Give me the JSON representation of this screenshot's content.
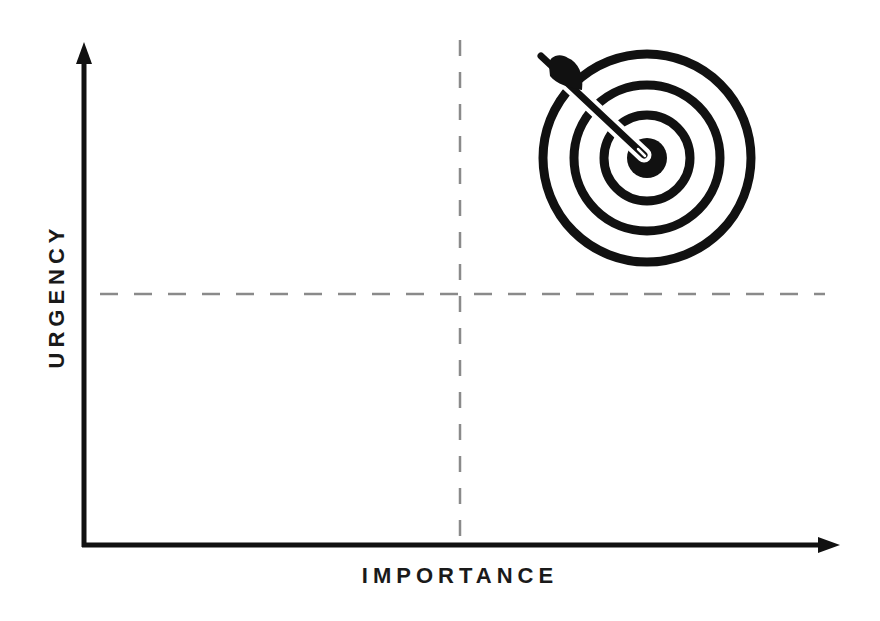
{
  "diagram": {
    "type": "quadrant-matrix",
    "x_axis": {
      "label": "IMPORTANCE"
    },
    "y_axis": {
      "label": "URGENCY"
    },
    "dividers": {
      "vertical_x": 460,
      "horizontal_y": 294,
      "style": "dashed",
      "color": "#8a8a8a"
    },
    "icon": {
      "name": "target-with-arrow",
      "quadrant": "high-importance-high-urgency"
    },
    "colors": {
      "axis": "#111111",
      "background": "#ffffff",
      "icon": "#111111"
    }
  }
}
